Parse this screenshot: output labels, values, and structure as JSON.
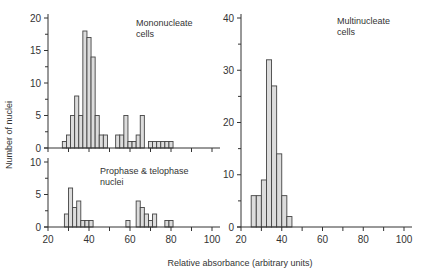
{
  "chart_data": [
    {
      "type": "bar",
      "panel": "top-left",
      "title": "Mononucleate cells",
      "title_lines": [
        "Mononucleate",
        "cells"
      ],
      "xlabel": "Relative absorbance (arbitrary units)",
      "ylabel": "Number of nuclei",
      "xlim": [
        20,
        100
      ],
      "ylim": [
        0,
        20
      ],
      "yticks": [
        0,
        5,
        10,
        15,
        20
      ],
      "bin_width": 2,
      "bins": [
        {
          "x0": 27,
          "count": 1
        },
        {
          "x0": 29,
          "count": 2
        },
        {
          "x0": 31,
          "count": 5
        },
        {
          "x0": 33,
          "count": 8
        },
        {
          "x0": 35,
          "count": 5
        },
        {
          "x0": 37,
          "count": 18
        },
        {
          "x0": 39,
          "count": 17
        },
        {
          "x0": 41,
          "count": 14
        },
        {
          "x0": 43,
          "count": 5
        },
        {
          "x0": 45,
          "count": 2
        },
        {
          "x0": 47,
          "count": 2
        },
        {
          "x0": 53,
          "count": 2
        },
        {
          "x0": 55,
          "count": 2
        },
        {
          "x0": 57,
          "count": 5
        },
        {
          "x0": 59,
          "count": 1
        },
        {
          "x0": 61,
          "count": 1
        },
        {
          "x0": 63,
          "count": 2
        },
        {
          "x0": 65,
          "count": 5
        },
        {
          "x0": 69,
          "count": 1
        },
        {
          "x0": 71,
          "count": 1
        },
        {
          "x0": 73,
          "count": 1
        },
        {
          "x0": 75,
          "count": 1
        },
        {
          "x0": 77,
          "count": 1
        },
        {
          "x0": 79,
          "count": 1
        }
      ]
    },
    {
      "type": "bar",
      "panel": "bottom-left",
      "title": "Prophase & telophase nuclei",
      "title_lines": [
        "Prophase & telophase",
        "nuclei"
      ],
      "xlabel": "Relative absorbance (arbitrary units)",
      "ylabel": "Number of nuclei",
      "xlim": [
        20,
        100
      ],
      "ylim": [
        0,
        10
      ],
      "yticks": [
        0,
        5,
        10
      ],
      "xticks": [
        20,
        40,
        60,
        80,
        100
      ],
      "bin_width": 2,
      "bins": [
        {
          "x0": 28,
          "count": 2
        },
        {
          "x0": 30,
          "count": 6
        },
        {
          "x0": 32,
          "count": 3
        },
        {
          "x0": 34,
          "count": 4
        },
        {
          "x0": 36,
          "count": 1
        },
        {
          "x0": 38,
          "count": 1
        },
        {
          "x0": 40,
          "count": 1
        },
        {
          "x0": 58,
          "count": 1
        },
        {
          "x0": 63,
          "count": 4
        },
        {
          "x0": 65,
          "count": 3
        },
        {
          "x0": 67,
          "count": 2
        },
        {
          "x0": 69,
          "count": 1
        },
        {
          "x0": 71,
          "count": 2
        },
        {
          "x0": 77,
          "count": 1
        },
        {
          "x0": 79,
          "count": 1
        }
      ]
    },
    {
      "type": "bar",
      "panel": "right",
      "title": "Multinucleate cells",
      "title_lines": [
        "Multinucleate",
        "cells"
      ],
      "xlabel": "Relative absorbance (arbitrary units)",
      "xlim": [
        20,
        100
      ],
      "ylim": [
        0,
        40
      ],
      "yticks": [
        0,
        10,
        20,
        30,
        40
      ],
      "xticks": [
        20,
        40,
        60,
        80,
        100
      ],
      "bin_width": 2.5,
      "bins": [
        {
          "x0": 25,
          "count": 6
        },
        {
          "x0": 27.5,
          "count": 6
        },
        {
          "x0": 30,
          "count": 9
        },
        {
          "x0": 32.5,
          "count": 32
        },
        {
          "x0": 35,
          "count": 27
        },
        {
          "x0": 37.5,
          "count": 14
        },
        {
          "x0": 40,
          "count": 6
        },
        {
          "x0": 42.5,
          "count": 2
        }
      ]
    }
  ],
  "labels": {
    "ylabel": "Number of nuclei",
    "xlabel": "Relative absorbance (arbitrary units)"
  },
  "colors": {
    "bar_fill": "#dcdcdc",
    "bar_stroke": "#444444",
    "axis": "#333333",
    "text": "#333333"
  }
}
